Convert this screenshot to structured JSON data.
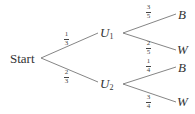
{
  "diagram": {
    "type": "probability-tree",
    "root": {
      "label": "Start"
    },
    "level1": [
      {
        "id": "U1",
        "base": "U",
        "sub": "1",
        "prob_num": "1",
        "prob_den": "3"
      },
      {
        "id": "U2",
        "base": "U",
        "sub": "2",
        "prob_num": "2",
        "prob_den": "3"
      }
    ],
    "level2": [
      {
        "parent": "U1",
        "label": "B",
        "prob_num": "3",
        "prob_den": "5"
      },
      {
        "parent": "U1",
        "label": "W",
        "prob_num": "2",
        "prob_den": "5"
      },
      {
        "parent": "U2",
        "label": "B",
        "prob_num": "1",
        "prob_den": "4"
      },
      {
        "parent": "U2",
        "label": "W",
        "prob_num": "3",
        "prob_den": "4"
      }
    ],
    "colors": {
      "line": "#777777",
      "text": "#333333"
    }
  }
}
